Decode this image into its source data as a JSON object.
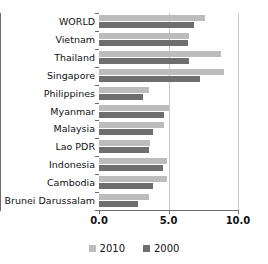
{
  "chart_data": {
    "type": "bar",
    "orientation": "horizontal",
    "title": "",
    "subtitle": "",
    "xlabel": "",
    "ylabel": "",
    "xlim": [
      0.0,
      10.0
    ],
    "xticks": [
      "0.0",
      "5.0",
      "10.0"
    ],
    "xtick_values": [
      0.0,
      5.0,
      10.0
    ],
    "grid": true,
    "grid_axis": "x",
    "legend_position": "bottom-center",
    "categories": [
      "WORLD",
      "Vietnam",
      "Thailand",
      "Singapore",
      "Philippines",
      "Myanmar",
      "Malaysia",
      "Lao PDR",
      "Indonesia",
      "Cambodia",
      "Brunei Darussalam"
    ],
    "series": [
      {
        "name": "2010",
        "color": "#bcbcbc",
        "values": [
          7.6,
          6.5,
          8.8,
          9.0,
          3.6,
          5.0,
          4.7,
          3.7,
          4.9,
          4.9,
          3.6
        ]
      },
      {
        "name": "2000",
        "color": "#6e6e6e",
        "values": [
          6.8,
          6.4,
          6.5,
          7.3,
          3.2,
          4.7,
          3.9,
          3.6,
          4.6,
          3.9,
          2.8
        ]
      }
    ]
  },
  "legend": {
    "items": [
      {
        "label": "2010",
        "color": "#bcbcbc"
      },
      {
        "label": "2000",
        "color": "#6e6e6e"
      }
    ]
  },
  "colors": {
    "series_2010": "#bcbcbc",
    "series_2000": "#6e6e6e",
    "axis": "#6b6b6b",
    "grid": "#c9c9c9",
    "background": "#ffffff",
    "text": "#111111"
  }
}
